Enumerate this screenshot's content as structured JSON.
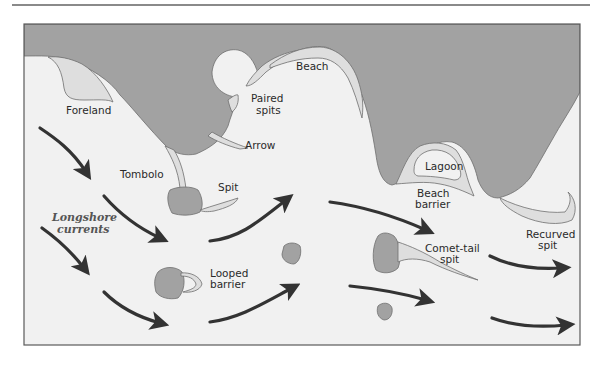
{
  "figure": {
    "colors": {
      "land": "#a2a2a2",
      "sea": "#f1f1f1",
      "deposit": "#dedede",
      "outline": "#6e6e6e",
      "arrow": "#333333",
      "frame": "#5a5a5a",
      "rule": "#8a8a8a"
    },
    "labels": {
      "foreland": "Foreland",
      "paired_spits_1": "Paired",
      "paired_spits_2": "spits",
      "beach": "Beach",
      "arrow": "Arrow",
      "tombolo": "Tombolo",
      "spit": "Spit",
      "longshore_1": "Longshore",
      "longshore_2": "currents",
      "lagoon": "Lagoon",
      "beach_barrier_1": "Beach",
      "beach_barrier_2": "barrier",
      "looped_barrier_1": "Looped",
      "looped_barrier_2": "barrier",
      "comet_tail_1": "Comet-tail",
      "comet_tail_2": "spit",
      "recurved_1": "Recurved",
      "recurved_2": "spit"
    },
    "current_arrows_count": 12
  }
}
